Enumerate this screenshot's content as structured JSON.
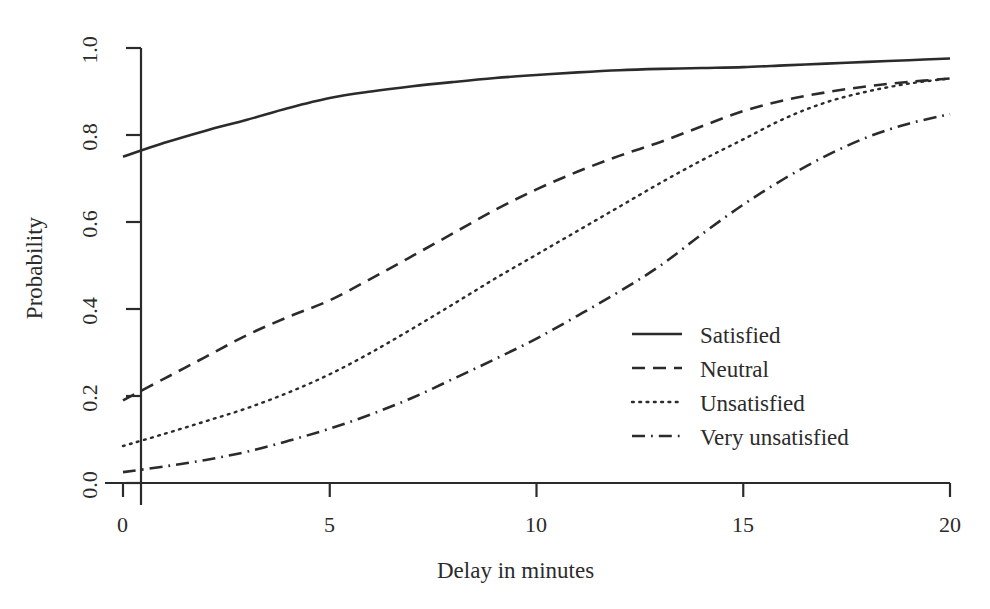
{
  "chart_data": {
    "type": "line",
    "title": "",
    "xlabel": "Delay in minutes",
    "ylabel": "Probability",
    "xlim": [
      0,
      20
    ],
    "ylim": [
      0.0,
      1.0
    ],
    "xticks": [
      0,
      5,
      10,
      15,
      20
    ],
    "xtick_labels": [
      "0",
      "5",
      "10",
      "15",
      "20"
    ],
    "yticks": [
      0.0,
      0.2,
      0.4,
      0.6,
      0.8,
      1.0
    ],
    "ytick_labels": [
      "0.0",
      "0.2",
      "0.4",
      "0.6",
      "0.8",
      "1.0"
    ],
    "grid": false,
    "legend_position": "center-right",
    "line_color": "#2b2b2b",
    "x": [
      0,
      1,
      2,
      3,
      4,
      5,
      6,
      7,
      8,
      9,
      10,
      11,
      12,
      13,
      14,
      15,
      16,
      17,
      18,
      19,
      20
    ],
    "series": [
      {
        "name": "Satisfied",
        "style": "solid",
        "values": [
          0.75,
          0.782,
          0.81,
          0.835,
          0.862,
          0.885,
          0.9,
          0.912,
          0.922,
          0.931,
          0.938,
          0.944,
          0.949,
          0.952,
          0.954,
          0.956,
          0.96,
          0.964,
          0.968,
          0.972,
          0.976
        ]
      },
      {
        "name": "Neutral",
        "style": "dashed",
        "values": [
          0.19,
          0.24,
          0.29,
          0.34,
          0.382,
          0.42,
          0.47,
          0.522,
          0.575,
          0.628,
          0.675,
          0.716,
          0.752,
          0.784,
          0.82,
          0.855,
          0.88,
          0.898,
          0.912,
          0.922,
          0.93
        ]
      },
      {
        "name": "Unsatisfied",
        "style": "dotted",
        "values": [
          0.085,
          0.113,
          0.142,
          0.172,
          0.208,
          0.25,
          0.3,
          0.355,
          0.412,
          0.47,
          0.525,
          0.58,
          0.635,
          0.69,
          0.742,
          0.79,
          0.838,
          0.875,
          0.9,
          0.918,
          0.93
        ]
      },
      {
        "name": "Very unsatisfied",
        "style": "dashdot",
        "values": [
          0.025,
          0.038,
          0.053,
          0.072,
          0.097,
          0.125,
          0.158,
          0.196,
          0.24,
          0.285,
          0.332,
          0.385,
          0.44,
          0.5,
          0.572,
          0.64,
          0.7,
          0.752,
          0.795,
          0.826,
          0.848
        ]
      }
    ]
  },
  "axes": {
    "ylabel": "Probability",
    "xlabel": "Delay in minutes",
    "xtick_labels": [
      "0",
      "5",
      "10",
      "15",
      "20"
    ],
    "ytick_labels": [
      "0.0",
      "0.2",
      "0.4",
      "0.6",
      "0.8",
      "1.0"
    ]
  },
  "legend": {
    "items": [
      {
        "label": "Satisfied",
        "style": "solid"
      },
      {
        "label": "Neutral",
        "style": "dashed"
      },
      {
        "label": "Unsatisfied",
        "style": "dotted"
      },
      {
        "label": "Very unsatisfied",
        "style": "dashdot"
      }
    ]
  }
}
